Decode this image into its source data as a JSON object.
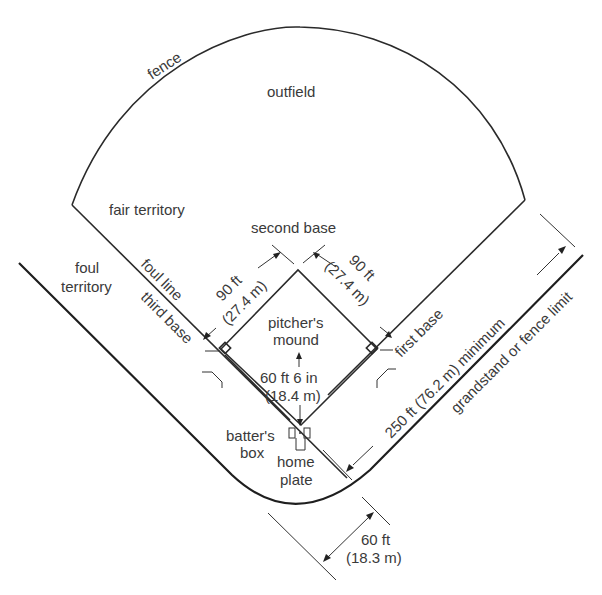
{
  "diagram": {
    "labels": {
      "fence": "fence",
      "outfield": "outfield",
      "fair_territory": "fair territory",
      "foul_territory_line1": "foul",
      "foul_territory_line2": "territory",
      "foul_line": "foul line",
      "second_base": "second base",
      "third_base": "third base",
      "first_base": "first base",
      "pitchers_mound_line1": "pitcher's",
      "pitchers_mound_line2": "mound",
      "batters_box_line1": "batter's",
      "batters_box_line2": "box",
      "home_plate_line1": "home",
      "home_plate_line2": "plate",
      "grandstand": "grandstand or fence limit"
    },
    "dimensions": {
      "base_path_left_ft": "90 ft",
      "base_path_left_m": "(27.4 m)",
      "base_path_right_ft": "90 ft",
      "base_path_right_m": "(27.4 m)",
      "pitch_distance_ft": "60 ft 6 in",
      "pitch_distance_m": "(18.4 m)",
      "foul_line_min": "250 ft (76.2 m) minimum",
      "backstop_ft": "60 ft",
      "backstop_m": "(18.3 m)"
    }
  }
}
